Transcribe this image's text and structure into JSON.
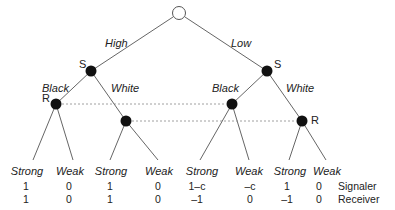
{
  "tree": {
    "root": {
      "type": "chance"
    },
    "nature_moves": [
      "High",
      "Low"
    ],
    "signaler_label": "S",
    "receiver_label": "R",
    "signaler_moves": [
      "Black",
      "White",
      "Black",
      "White"
    ],
    "leaves": [
      {
        "action": "Strong",
        "signaler": "1",
        "receiver": "1"
      },
      {
        "action": "Weak",
        "signaler": "0",
        "receiver": "0"
      },
      {
        "action": "Strong",
        "signaler": "1",
        "receiver": "1"
      },
      {
        "action": "Weak",
        "signaler": "0",
        "receiver": "0"
      },
      {
        "action": "Strong",
        "signaler": "1–c",
        "receiver": "–1"
      },
      {
        "action": "Weak",
        "signaler": "–c",
        "receiver": "0"
      },
      {
        "action": "Strong",
        "signaler": "1",
        "receiver": "–1"
      },
      {
        "action": "Weak",
        "signaler": "0",
        "receiver": "0"
      }
    ],
    "row_labels": {
      "signaler": "Signaler",
      "receiver": "Receiver"
    }
  },
  "colors": {
    "line": "#555555",
    "node": "#111111",
    "dotted": "#888888"
  }
}
